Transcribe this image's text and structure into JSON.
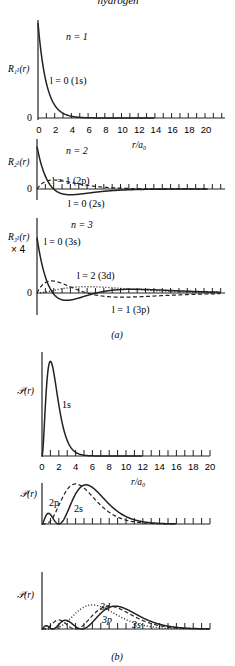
{
  "header": {
    "partial_title": "hydrogen"
  },
  "part_a": {
    "caption": "(a)",
    "xaxis": {
      "label": "r/a₀",
      "ticks": [
        "0",
        "2",
        "4",
        "6",
        "8",
        "10",
        "12",
        "14",
        "16",
        "18",
        "20"
      ]
    },
    "panels": [
      {
        "id": "n1",
        "ylabel": "R₁ₗ(r)",
        "n_label": "n = 1",
        "zero_label": "0",
        "curves": [
          {
            "label": "l = 0 (1s)",
            "style": "solid"
          }
        ]
      },
      {
        "id": "n2",
        "ylabel": "R₂ₗ(r)",
        "n_label": "n = 2",
        "zero_label": "0",
        "curves": [
          {
            "label": "l = 1 (2p)",
            "style": "dashed"
          },
          {
            "label": "l = 0 (2s)",
            "style": "solid"
          }
        ]
      },
      {
        "id": "n3",
        "ylabel": "R₃ₗ(r)",
        "scale_label": "× 4",
        "n_label": "n = 3",
        "zero_label": "0",
        "curves": [
          {
            "label": "l = 0 (3s)",
            "style": "solid"
          },
          {
            "label": "l = 2 (3d)",
            "style": "dotted"
          },
          {
            "label": "l = 1 (3p)",
            "style": "dashed"
          }
        ]
      }
    ]
  },
  "part_b": {
    "caption": "(b)",
    "xaxis": {
      "label": "r/a₀",
      "ticks": [
        "0",
        "2",
        "4",
        "6",
        "8",
        "10",
        "12",
        "14",
        "16",
        "18",
        "20"
      ]
    },
    "panels": [
      {
        "id": "p1",
        "ylabel": "𝒫(r)",
        "curves": [
          {
            "label": "1s",
            "style": "solid"
          }
        ]
      },
      {
        "id": "p2",
        "ylabel": "𝒫(r)",
        "curves": [
          {
            "label": "2p",
            "style": "dashed"
          },
          {
            "label": "2s",
            "style": "solid"
          }
        ]
      },
      {
        "id": "p3",
        "ylabel": "𝒫(r)",
        "curves": [
          {
            "label": "3d",
            "style": "dotted"
          },
          {
            "label": "3p",
            "style": "dashed"
          },
          {
            "label": "3s",
            "style": "solid"
          }
        ]
      }
    ]
  }
}
